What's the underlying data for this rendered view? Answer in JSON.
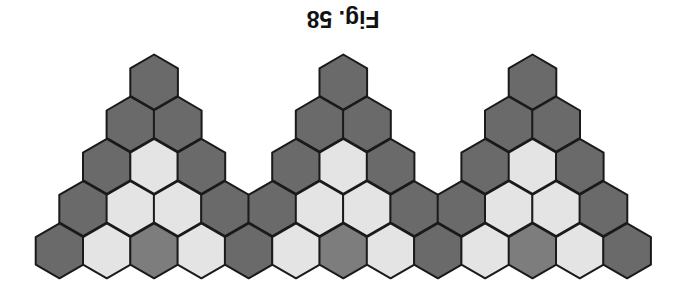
{
  "caption": "Fig. 58",
  "colors": {
    "dark": "#6a6a6a",
    "medium": "#7d7d7d",
    "light": "#e4e4e4",
    "outline": "#1a1a1a"
  },
  "grid": {
    "origin_x": 59.5,
    "pitch_x": 47.3,
    "top_y": 82,
    "row_pitch": 42.2,
    "hex_radius": 27.5
  },
  "rows": [
    {
      "row": 0,
      "cells": [
        {
          "pos": 2,
          "fill": "dark"
        },
        {
          "pos": 6,
          "fill": "dark"
        },
        {
          "pos": 10,
          "fill": "dark"
        }
      ]
    },
    {
      "row": 1,
      "cells": [
        {
          "pos": 1.5,
          "fill": "dark"
        },
        {
          "pos": 2.5,
          "fill": "dark"
        },
        {
          "pos": 5.5,
          "fill": "dark"
        },
        {
          "pos": 6.5,
          "fill": "dark"
        },
        {
          "pos": 9.5,
          "fill": "dark"
        },
        {
          "pos": 10.5,
          "fill": "dark"
        }
      ]
    },
    {
      "row": 2,
      "cells": [
        {
          "pos": 1,
          "fill": "dark"
        },
        {
          "pos": 2,
          "fill": "light"
        },
        {
          "pos": 3,
          "fill": "dark"
        },
        {
          "pos": 5,
          "fill": "dark"
        },
        {
          "pos": 6,
          "fill": "light"
        },
        {
          "pos": 7,
          "fill": "dark"
        },
        {
          "pos": 9,
          "fill": "dark"
        },
        {
          "pos": 10,
          "fill": "light"
        },
        {
          "pos": 11,
          "fill": "dark"
        }
      ]
    },
    {
      "row": 3,
      "cells": [
        {
          "pos": 0.5,
          "fill": "dark"
        },
        {
          "pos": 1.5,
          "fill": "light"
        },
        {
          "pos": 2.5,
          "fill": "light"
        },
        {
          "pos": 3.5,
          "fill": "dark"
        },
        {
          "pos": 4.5,
          "fill": "dark"
        },
        {
          "pos": 5.5,
          "fill": "light"
        },
        {
          "pos": 6.5,
          "fill": "light"
        },
        {
          "pos": 7.5,
          "fill": "dark"
        },
        {
          "pos": 8.5,
          "fill": "dark"
        },
        {
          "pos": 9.5,
          "fill": "light"
        },
        {
          "pos": 10.5,
          "fill": "light"
        },
        {
          "pos": 11.5,
          "fill": "dark"
        }
      ]
    },
    {
      "row": 4,
      "cells": [
        {
          "pos": 0,
          "fill": "dark"
        },
        {
          "pos": 1,
          "fill": "light"
        },
        {
          "pos": 2,
          "fill": "medium"
        },
        {
          "pos": 3,
          "fill": "light"
        },
        {
          "pos": 4,
          "fill": "dark"
        },
        {
          "pos": 5,
          "fill": "light"
        },
        {
          "pos": 6,
          "fill": "medium"
        },
        {
          "pos": 7,
          "fill": "light"
        },
        {
          "pos": 8,
          "fill": "dark"
        },
        {
          "pos": 9,
          "fill": "light"
        },
        {
          "pos": 10,
          "fill": "medium"
        },
        {
          "pos": 11,
          "fill": "light"
        },
        {
          "pos": 12,
          "fill": "dark"
        }
      ]
    }
  ]
}
